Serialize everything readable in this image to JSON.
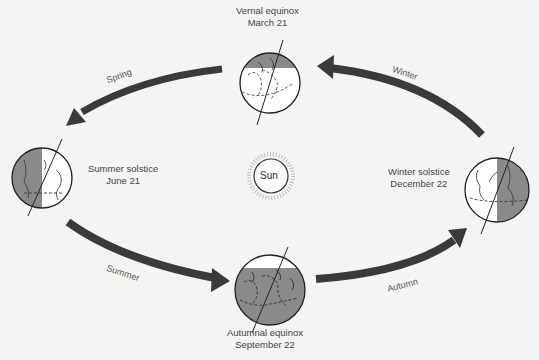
{
  "diagram": {
    "sun": {
      "label": "Sun"
    },
    "positions": [
      {
        "id": "vernal",
        "name": "Vernal equinox",
        "date": "March 21"
      },
      {
        "id": "summer",
        "name": "Summer solstice",
        "date": "June 21"
      },
      {
        "id": "autumnal",
        "name": "Autumnal equinox",
        "date": "September 22"
      },
      {
        "id": "winter",
        "name": "Winter solstice",
        "date": "December 22"
      }
    ],
    "seasons": [
      {
        "id": "spring",
        "label": "Spring"
      },
      {
        "id": "summer",
        "label": "Summer"
      },
      {
        "id": "autumn",
        "label": "Autumn"
      },
      {
        "id": "winter",
        "label": "Winter"
      }
    ],
    "colors": {
      "background": "#f4f4f2",
      "arrow": "#3a3a3a",
      "shadow": "#8a8a8a",
      "outline": "#222222",
      "text": "#444444"
    }
  }
}
